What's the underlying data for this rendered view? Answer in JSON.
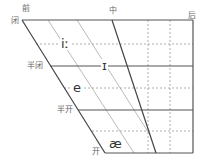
{
  "diagram": {
    "type": "vowel-trapezoid",
    "top_labels": {
      "front": "前",
      "central": "中",
      "back": "后"
    },
    "height_labels": {
      "close": "闭",
      "close_mid": "半闭",
      "open_mid": "半开",
      "open": "开"
    },
    "vowels": [
      {
        "symbol": "iː",
        "position": "front close-high"
      },
      {
        "symbol": "ɪ",
        "position": "near-front near-close"
      },
      {
        "symbol": "e",
        "position": "front mid"
      },
      {
        "symbol": "æ",
        "position": "front near-open"
      }
    ]
  }
}
